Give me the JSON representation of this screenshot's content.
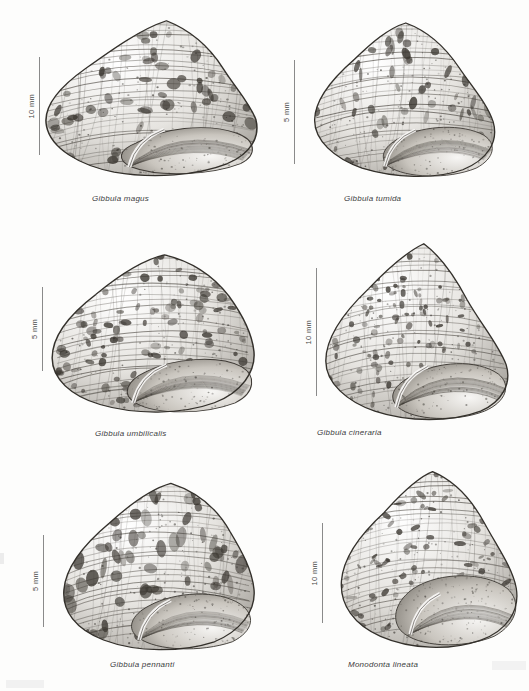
{
  "plate": {
    "kind": "scientific-illustration-plate",
    "subject": "marine gastropod shells (top-shells)",
    "background_color": "#fdfdfc",
    "ink_color": "#3c3c3c",
    "columns": 2,
    "rows": 3
  },
  "panels": [
    {
      "id": "gibbula-magus",
      "caption": "Gibbula magus",
      "scale_label": "10 mm",
      "scale_value": 10,
      "scale_unit": "mm",
      "caption_left": 92,
      "caption_top": 194,
      "bar_left": 28,
      "bar_top": 57,
      "bar_height": 98,
      "shell_left": 40,
      "shell_top": 14,
      "shell_width": 218,
      "shell_height": 170,
      "shell_shape": "broad-conical-low-spire-keeled",
      "seed": 11
    },
    {
      "id": "gibbula-tumida",
      "caption": "Gibbula tumida",
      "scale_label": "5 mm",
      "scale_value": 5,
      "scale_unit": "mm",
      "caption_left": 344,
      "caption_top": 194,
      "bar_left": 283,
      "bar_top": 60,
      "bar_height": 104,
      "shell_left": 307,
      "shell_top": 18,
      "shell_width": 190,
      "shell_height": 165,
      "shell_shape": "tall-rounded-conical-spiral-ridged",
      "seed": 23
    },
    {
      "id": "gibbula-umbilicalis",
      "caption": "Gibbula umbilicalis",
      "scale_label": "5 mm",
      "scale_value": 5,
      "scale_unit": "mm",
      "caption_left": 95,
      "caption_top": 429,
      "bar_left": 31,
      "bar_top": 287,
      "bar_height": 84,
      "shell_left": 48,
      "shell_top": 248,
      "shell_width": 208,
      "shell_height": 172,
      "shell_shape": "broad-domed-checkered-bands",
      "seed": 37
    },
    {
      "id": "gibbula-cineraria",
      "caption": "Gibbula cineraria",
      "scale_label": "10 mm",
      "scale_value": 10,
      "scale_unit": "mm",
      "caption_left": 317,
      "caption_top": 428,
      "bar_left": 305,
      "bar_top": 268,
      "bar_height": 128,
      "shell_left": 316,
      "shell_top": 240,
      "shell_width": 196,
      "shell_height": 186,
      "shell_shape": "conical-pointed-fine-oblique-stripes",
      "seed": 53
    },
    {
      "id": "gibbula-pennanti",
      "caption": "Gibbula pennanti",
      "scale_label": "5 mm",
      "scale_value": 5,
      "scale_unit": "mm",
      "caption_left": 110,
      "caption_top": 660,
      "bar_left": 32,
      "bar_top": 535,
      "bar_height": 92,
      "shell_left": 58,
      "shell_top": 478,
      "shell_width": 198,
      "shell_height": 180,
      "shell_shape": "broad-conical-bold-flame-bands",
      "seed": 67
    },
    {
      "id": "monodonta-lineata",
      "caption": "Monodonta lineata",
      "scale_label": "10 mm",
      "scale_value": 10,
      "scale_unit": "mm",
      "caption_left": 348,
      "caption_top": 660,
      "bar_left": 311,
      "bar_top": 523,
      "bar_height": 100,
      "shell_left": 334,
      "shell_top": 468,
      "shell_width": 186,
      "shell_height": 185,
      "shell_shape": "thick-globose-zigzag-pattern",
      "seed": 79
    }
  ]
}
